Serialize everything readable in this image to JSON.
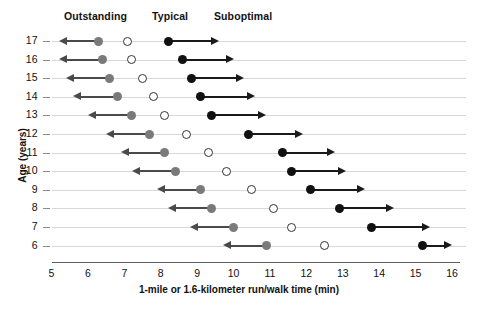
{
  "chart_data": {
    "type": "scatter",
    "title": "",
    "xlabel": "1-mile or 1.6-kilometer run/walk time (min)",
    "ylabel": "Age (years)",
    "xlim": [
      5,
      16
    ],
    "ylim_categories": [
      17,
      16,
      15,
      14,
      13,
      12,
      11,
      10,
      9,
      8,
      7,
      6
    ],
    "xticks": [
      5,
      6,
      7,
      8,
      9,
      10,
      11,
      12,
      13,
      14,
      15,
      16
    ],
    "grid": true,
    "legend_position": "top",
    "legend": [
      {
        "label": "Outstanding",
        "marker": "gray-filled-circle-with-left-arrow",
        "color": "#7a7a7a"
      },
      {
        "label": "Typical",
        "marker": "open-circle",
        "color": "#ffffff"
      },
      {
        "label": "Suboptimal",
        "marker": "black-filled-circle-with-right-arrow",
        "color": "#111111"
      }
    ],
    "series": [
      {
        "name": "Outstanding",
        "marker": "gray-circle",
        "direction": "left-arrow",
        "values": [
          6.3,
          6.4,
          6.6,
          6.8,
          7.2,
          7.7,
          8.1,
          8.4,
          9.1,
          9.4,
          10.0,
          10.9
        ],
        "arrow_end": [
          5.2,
          5.2,
          5.4,
          5.6,
          6.0,
          6.5,
          6.9,
          7.2,
          7.9,
          8.2,
          8.8,
          9.7
        ]
      },
      {
        "name": "Typical",
        "marker": "open-circle",
        "direction": "none",
        "values": [
          7.1,
          7.2,
          7.5,
          7.8,
          8.1,
          8.7,
          9.3,
          9.8,
          10.5,
          11.1,
          11.6,
          12.5
        ],
        "arrow_end": [
          null,
          null,
          null,
          null,
          null,
          null,
          null,
          null,
          null,
          null,
          null,
          null
        ]
      },
      {
        "name": "Suboptimal",
        "marker": "black-circle",
        "direction": "right-arrow",
        "values": [
          8.2,
          8.6,
          8.85,
          9.1,
          9.4,
          10.4,
          11.35,
          11.6,
          12.1,
          12.9,
          13.8,
          15.2
        ],
        "arrow_end": [
          9.6,
          10.0,
          10.3,
          10.6,
          10.9,
          11.9,
          12.8,
          13.1,
          13.6,
          14.4,
          15.4,
          16.0
        ]
      }
    ],
    "rows": [
      {
        "age": "17",
        "outstanding": 6.3,
        "outstanding_arrow_end": 5.2,
        "typical": 7.1,
        "suboptimal": 8.2,
        "suboptimal_arrow_end": 9.6
      },
      {
        "age": "16",
        "outstanding": 6.4,
        "outstanding_arrow_end": 5.2,
        "typical": 7.2,
        "suboptimal": 8.6,
        "suboptimal_arrow_end": 10.0
      },
      {
        "age": "15",
        "outstanding": 6.6,
        "outstanding_arrow_end": 5.4,
        "typical": 7.5,
        "suboptimal": 8.85,
        "suboptimal_arrow_end": 10.3
      },
      {
        "age": "14",
        "outstanding": 6.8,
        "outstanding_arrow_end": 5.6,
        "typical": 7.8,
        "suboptimal": 9.1,
        "suboptimal_arrow_end": 10.6
      },
      {
        "age": "13",
        "outstanding": 7.2,
        "outstanding_arrow_end": 6.0,
        "typical": 8.1,
        "suboptimal": 9.4,
        "suboptimal_arrow_end": 10.9
      },
      {
        "age": "12",
        "outstanding": 7.7,
        "outstanding_arrow_end": 6.5,
        "typical": 8.7,
        "suboptimal": 10.4,
        "suboptimal_arrow_end": 11.9
      },
      {
        "age": "11",
        "outstanding": 8.1,
        "outstanding_arrow_end": 6.9,
        "typical": 9.3,
        "suboptimal": 11.35,
        "suboptimal_arrow_end": 12.8
      },
      {
        "age": "10",
        "outstanding": 8.4,
        "outstanding_arrow_end": 7.2,
        "typical": 9.8,
        "suboptimal": 11.6,
        "suboptimal_arrow_end": 13.1
      },
      {
        "age": "9",
        "outstanding": 9.1,
        "outstanding_arrow_end": 7.9,
        "typical": 10.5,
        "suboptimal": 12.1,
        "suboptimal_arrow_end": 13.6
      },
      {
        "age": "8",
        "outstanding": 9.4,
        "outstanding_arrow_end": 8.2,
        "typical": 11.1,
        "suboptimal": 12.9,
        "suboptimal_arrow_end": 14.4
      },
      {
        "age": "7",
        "outstanding": 10.0,
        "outstanding_arrow_end": 8.8,
        "typical": 11.6,
        "suboptimal": 13.8,
        "suboptimal_arrow_end": 15.4
      },
      {
        "age": "6",
        "outstanding": 10.9,
        "outstanding_arrow_end": 9.7,
        "typical": 12.5,
        "suboptimal": 15.2,
        "suboptimal_arrow_end": 16.0
      }
    ]
  },
  "colors": {
    "outstanding": "#7a7a7a",
    "typical": "#ffffff",
    "suboptimal": "#111111",
    "grid": "#d8d8d8",
    "axis": "#5d5d5d"
  }
}
